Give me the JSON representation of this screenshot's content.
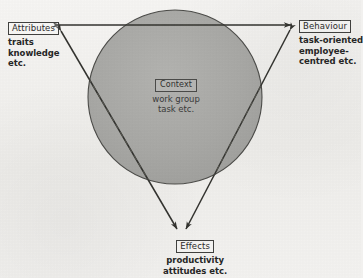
{
  "figure": {
    "background_color": "#f2f1ef",
    "line_color": "#3a3a38",
    "circle_fill": "#a9a9a6"
  },
  "nodes": {
    "attributes": {
      "label": "Attributes",
      "desc_line1": "traits",
      "desc_line2": "knowledge",
      "desc_line3": "etc."
    },
    "behaviour": {
      "label": "Behaviour",
      "desc_line1": "task-oriented",
      "desc_line2": "employee-",
      "desc_line3": "centred etc."
    },
    "effects": {
      "label": "Effects",
      "desc_line1": "productivity",
      "desc_line2": "attitudes etc.",
      "desc_line3": ""
    },
    "context": {
      "label": "Context",
      "desc_line1": "work group",
      "desc_line2": "task etc.",
      "desc_line3": ""
    }
  },
  "connections": [
    {
      "name": "attributes-behaviour",
      "from": "attributes",
      "to": "behaviour",
      "arrows": "both"
    },
    {
      "name": "attributes-effects",
      "from": "attributes",
      "to": "effects",
      "arrows": "both"
    },
    {
      "name": "behaviour-effects",
      "from": "behaviour",
      "to": "effects",
      "arrows": "both"
    }
  ]
}
